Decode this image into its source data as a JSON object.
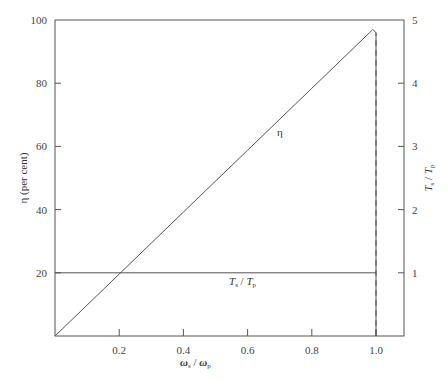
{
  "chart_data": {
    "type": "line",
    "title": "",
    "xlabel": "ω_s / ω_p",
    "ylabel_left": "η (per cent)",
    "ylabel_right": "T_s / T_p",
    "xlim": [
      0,
      1.1
    ],
    "ylim_left": [
      0,
      100
    ],
    "ylim_right": [
      0,
      5
    ],
    "x_ticks": [
      "0.2",
      "0.4",
      "0.6",
      "0.8",
      "1.0"
    ],
    "y_ticks_left": [
      "20",
      "40",
      "60",
      "80",
      "100"
    ],
    "y_ticks_right": [
      "1",
      "2",
      "3",
      "4",
      "5"
    ],
    "grid": false,
    "series": [
      {
        "name": "η",
        "axis": "left",
        "style": "solid",
        "x": [
          0,
          0.2,
          0.4,
          0.6,
          0.8,
          0.98,
          0.99,
          1.0,
          1.0
        ],
        "y": [
          0,
          19.6,
          39.2,
          58.8,
          78.4,
          96,
          97,
          96,
          0
        ]
      },
      {
        "name": "T_s / T_p",
        "axis": "right",
        "style": "solid",
        "x": [
          0,
          1.0
        ],
        "y": [
          1,
          1
        ]
      },
      {
        "name": "ω_s/ω_p = 1.0 boundary",
        "axis": "left",
        "style": "dashed",
        "x": [
          1.0,
          1.0
        ],
        "y": [
          0,
          96
        ]
      }
    ],
    "annotations": [
      {
        "text": "η",
        "x": 0.69,
        "y": 65
      },
      {
        "text": "T_s / T_p",
        "x": 0.55,
        "y": 17
      }
    ]
  },
  "labels": {
    "eta_curve": "η",
    "torque_curve_T": "T",
    "torque_curve_s": "s",
    "torque_curve_sep": " / ",
    "torque_curve_T2": "T",
    "torque_curve_p": "p",
    "xlabel_omega": "ω",
    "xlabel_s": "s",
    "xlabel_sep": " / ",
    "xlabel_omega2": "ω",
    "xlabel_p": "p",
    "ylabel_left": "η (per cent)",
    "ylabel_right_T": "T",
    "ylabel_right_s": "s",
    "ylabel_right_sep": " / ",
    "ylabel_right_T2": "T",
    "ylabel_right_p": "p"
  }
}
